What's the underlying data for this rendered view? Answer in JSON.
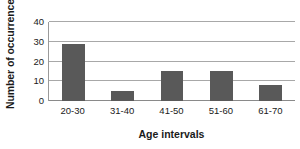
{
  "chart_data": {
    "type": "bar",
    "title": "",
    "categories": [
      "20-30",
      "31-40",
      "41-50",
      "51-60",
      "61-70"
    ],
    "values": [
      29,
      5,
      15,
      15,
      8
    ],
    "xlabel": "Age intervals",
    "ylabel": "Number of occurrences",
    "ylim": [
      0,
      40
    ],
    "yticks": [
      0,
      10,
      20,
      30,
      40
    ],
    "ytick_labels": [
      "0",
      "10",
      "20",
      "30",
      "40"
    ],
    "grid": true,
    "grid_axis": "y",
    "legend": false,
    "legend_position": "none",
    "bar_color": "#595959",
    "plot_background": "#ffffff",
    "gridline_color": "#a8a8a8",
    "axis_color": "#8a8a8a",
    "text_color": "#1a1a1a"
  }
}
